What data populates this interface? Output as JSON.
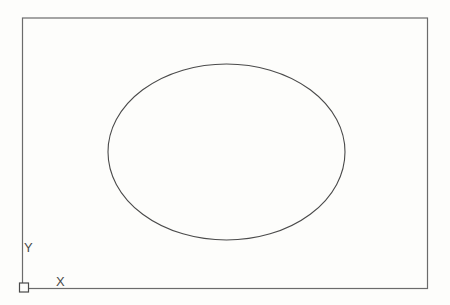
{
  "drawing": {
    "background_color": "#fdfdfb",
    "frame_line_color": "#6b6b6b",
    "shape_line_color": "#4a4a4a",
    "label_color": "#4a4a4a",
    "ucs_icon": {
      "x_axis_label": "X",
      "y_axis_label": "Y"
    }
  }
}
